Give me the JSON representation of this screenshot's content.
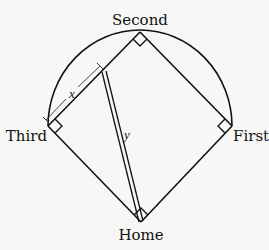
{
  "diagram": {
    "labels": {
      "second": "Second",
      "third": "Third",
      "first": "First",
      "home": "Home"
    },
    "variables": {
      "x": "x",
      "y": "y"
    },
    "colors": {
      "stroke": "#111111",
      "background": "#f7f7f5"
    }
  }
}
